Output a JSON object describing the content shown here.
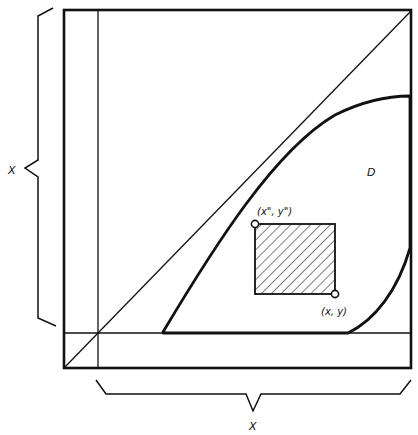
{
  "diagram": {
    "type": "mathematical-region-diagram",
    "labels": {
      "left_brace": "X",
      "bottom_brace": "X",
      "region": "D",
      "upper_left_point": "(x\", y\")",
      "lower_right_point": "(x, y)"
    },
    "elements": [
      "outer square",
      "diagonal line from lower-left to upper-right corner",
      "vertical line near left edge",
      "horizontal line near bottom edge",
      "curved region D below diagonal",
      "hatched rectangle inside D with corners marked",
      "brace on left labeled X",
      "brace on bottom labeled X"
    ],
    "colors": {
      "stroke": "#111111",
      "background": "#ffffff"
    }
  }
}
